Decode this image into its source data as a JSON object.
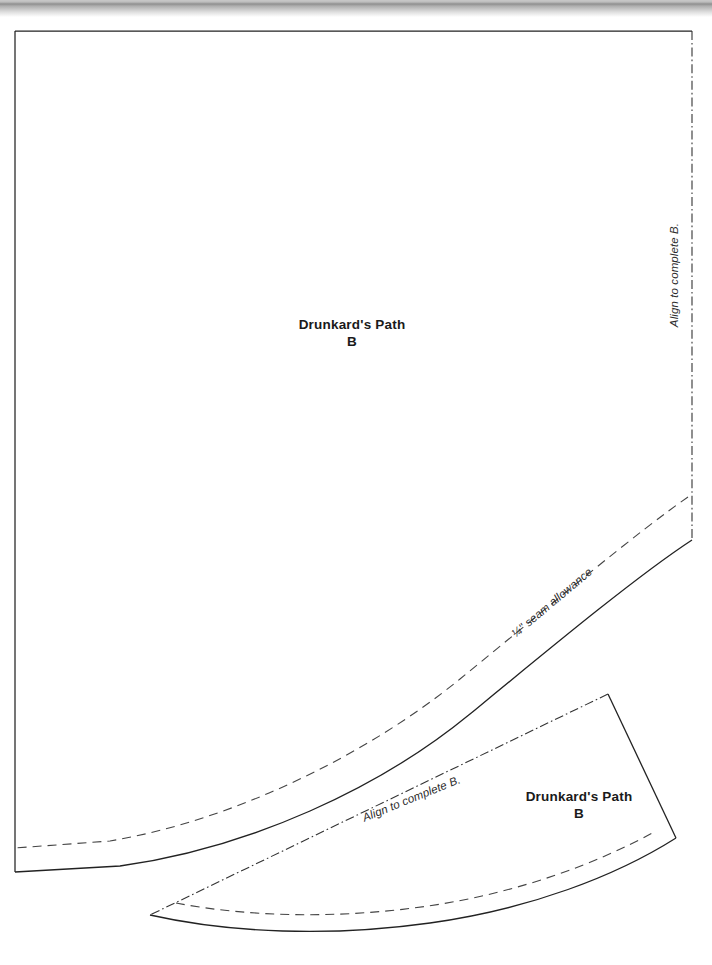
{
  "document": {
    "title": "Drunkard's Path pattern template sheet",
    "page_background": "#ffffff",
    "line_color": "#222222",
    "scan_artifact_color": "#8f8f8f"
  },
  "pieces": [
    {
      "id": "large-piece",
      "name": "Drunkard's Path B (large)",
      "label_line1": "Drunkard's Path",
      "label_line2": "B",
      "edges": {
        "top": "solid",
        "left": "solid",
        "right": "dash-dot",
        "curve_cut": "solid",
        "curve_seam": "dashed"
      }
    },
    {
      "id": "small-piece",
      "name": "Drunkard's Path B (small wedge)",
      "label_line1": "Drunkard's Path",
      "label_line2": "B",
      "edges": {
        "upper_left": "dash-dot",
        "right": "solid",
        "arc_cut": "solid",
        "arc_seam": "dashed"
      }
    }
  ],
  "annotations": {
    "align_right": "Align to complete B.",
    "seam_allowance": "¼\" seam allowance",
    "align_lower": "Align to complete B."
  }
}
